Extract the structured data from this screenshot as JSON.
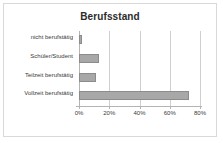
{
  "chart_data": {
    "type": "bar",
    "orientation": "horizontal",
    "title": "Berufsstand",
    "xlabel": "",
    "ylabel": "",
    "categories": [
      "nicht berufstätig",
      "Schüler/Student",
      "Teilzeit berufstätig",
      "Vollzeit berufstätig"
    ],
    "values": [
      2,
      13,
      11,
      73
    ],
    "xlim": [
      0,
      80
    ],
    "xtick_labels": [
      "0%",
      "20%",
      "40%",
      "60%",
      "80%"
    ],
    "xtick_values": [
      0,
      20,
      40,
      60,
      80
    ],
    "grid": true,
    "legend": false,
    "colors": {
      "bar_fill": "#a8a8a8",
      "bar_border": "#8c8c8c",
      "gridline": "#cfcfcf",
      "axis": "#b4b4b4",
      "frame_border": "#d9d9d9",
      "background": "#ffffff",
      "title_text": "#2b2b2b",
      "label_text": "#3a3a3a"
    }
  }
}
